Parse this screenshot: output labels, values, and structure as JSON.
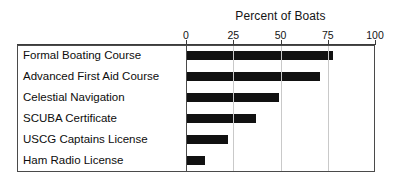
{
  "chart_data": {
    "type": "bar",
    "orientation": "horizontal",
    "title": "Percent of Boats",
    "xlabel": "",
    "ylabel": "",
    "xlim": [
      0,
      100
    ],
    "xticks": [
      0,
      25,
      50,
      75,
      100
    ],
    "xtick_labels": [
      "0",
      "25",
      "50",
      "75",
      "100"
    ],
    "grid": true,
    "grid_axis": "x",
    "legend": false,
    "bar_color": "#111111",
    "frame_color": "#4a4a4a",
    "gridline_color": "#c9c9c9",
    "categories": [
      "Formal Boating Course",
      "Advanced First Aid Course",
      "Celestial  Navigation",
      "SCUBA Certificate",
      "USCG Captains License",
      "Ham Radio License"
    ],
    "values": [
      78,
      71,
      49,
      37,
      22,
      10
    ]
  }
}
